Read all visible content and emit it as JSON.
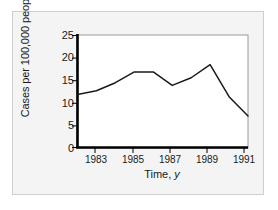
{
  "figure": {
    "background_color": "#f4f4f4",
    "border_color": "#cfcfcf",
    "plot_background": "#ffffff",
    "line_color": "#1a1a1a",
    "axis_color": "#000000"
  },
  "axis_titles": {
    "y": "Cases per 100,000 people",
    "x_prefix": "Time, ",
    "x_italic": "y"
  },
  "chart_data": {
    "type": "line",
    "title": "",
    "xlabel": "Time, y",
    "ylabel": "Cases per 100,000 people",
    "xlim": [
      1982,
      1991
    ],
    "ylim": [
      0,
      25
    ],
    "grid": false,
    "legend": "none",
    "x_ticks": [
      1983,
      1985,
      1987,
      1989,
      1991
    ],
    "y_ticks": [
      0,
      5,
      10,
      15,
      20,
      25
    ],
    "x": [
      1982,
      1983,
      1984,
      1985,
      1986,
      1987,
      1988,
      1989,
      1990,
      1991
    ],
    "values": [
      11.8,
      12.6,
      14.4,
      16.8,
      16.8,
      13.8,
      15.5,
      18.4,
      11.3,
      7.0
    ],
    "series_name": "Cases per 100,000 people"
  }
}
